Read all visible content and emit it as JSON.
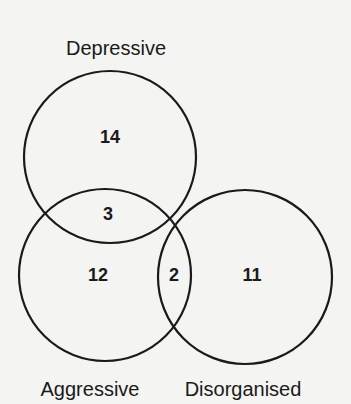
{
  "diagram": {
    "type": "venn",
    "sets": [
      {
        "id": "depressive",
        "label": "Depressive",
        "only_count": "14"
      },
      {
        "id": "aggressive",
        "label": "Aggressive",
        "only_count": "12"
      },
      {
        "id": "disorganised",
        "label": "Disorganised",
        "only_count": "11"
      }
    ],
    "intersections": [
      {
        "sets": [
          "depressive",
          "aggressive"
        ],
        "count": "3"
      },
      {
        "sets": [
          "aggressive",
          "disorganised"
        ],
        "count": "2"
      }
    ],
    "stroke_color": "#1a1a1a",
    "background_color": "#f4f4f2"
  }
}
